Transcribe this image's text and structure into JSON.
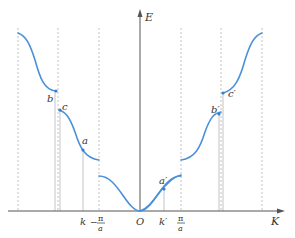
{
  "figure": {
    "type": "energy-band-diagram-extended-zone",
    "colors": {
      "curve": "#4a90d9",
      "axis": "#555555",
      "guide": "#c8c8c8",
      "dashed": "#c0c0c0",
      "text": "#333333"
    },
    "axes": {
      "y_label": "E",
      "x_label": "K",
      "origin_label": "O"
    },
    "tick_labels": {
      "k": "k",
      "k_prime": "k′",
      "neg_pi_num": "π",
      "neg_pi_den": "a",
      "neg_sign": "−",
      "pi_num": "π",
      "pi_den": "a"
    },
    "point_labels": {
      "a": "a",
      "a_prime": "a′",
      "b": "b",
      "b_prime": "b′",
      "c": "c",
      "c_prime": "c′"
    }
  }
}
